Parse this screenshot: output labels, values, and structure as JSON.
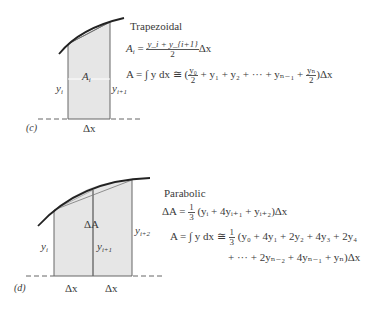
{
  "figure_c": {
    "panel_label": "(c)",
    "method_title": "Trapezoidal",
    "area_label": "A",
    "area_label_sub": "i",
    "left_height_label": "y",
    "left_height_sub": "i",
    "right_height_label": "y",
    "right_height_sub": "i+1",
    "width_label": "Δx",
    "formula_local": {
      "lhs": "A",
      "lhs_sub": "i",
      "eq": " = ",
      "numerator": "y_i + y_{i+1}",
      "denominator": "2",
      "tail": "Δx"
    },
    "formula_total": {
      "lhs": "A = ∫ y dx ≅ (",
      "first_num": "y₀",
      "first_den": "2",
      "middle": "+ y₁ + y₂ + ··· + yₙ₋₁ +",
      "last_num": "yₙ",
      "last_den": "2",
      "tail": ")Δx"
    }
  },
  "figure_d": {
    "panel_label": "(d)",
    "method_title": "Parabolic",
    "area_label": "ΔA",
    "left_height_label": "y",
    "left_height_sub": "i",
    "mid_height_label": "y",
    "mid_height_sub": "i+1",
    "right_height_label": "y",
    "right_height_sub": "i+2",
    "width_label_1": "Δx",
    "width_label_2": "Δx",
    "formula_local": {
      "lhs": "ΔA = ",
      "coef_num": "1",
      "coef_den": "3",
      "rhs": "(yᵢ + 4yᵢ₊₁ + yᵢ₊₂)Δx"
    },
    "formula_total": {
      "lhs": "A = ∫ y dx ≅ ",
      "coef_num": "1",
      "coef_den": "3",
      "line1": "(y₀ + 4y₁ + 2y₂ + 4y₃ + 2y₄",
      "line2": "+ ··· + 2yₙ₋₂ + 4yₙ₋₁ + yₙ)Δx"
    }
  },
  "colors": {
    "shade": "#e8e8e8",
    "line": "#555555",
    "curve": "#222222"
  }
}
